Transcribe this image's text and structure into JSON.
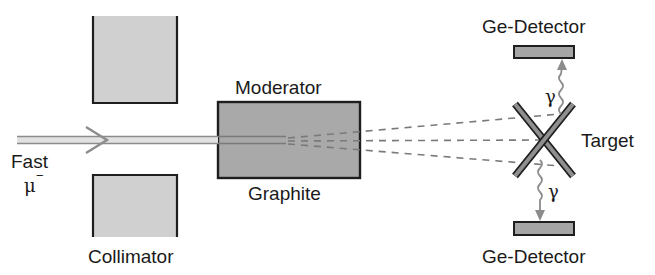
{
  "diagram": {
    "colors": {
      "block_fill": "#d0d0d0",
      "moderator_fill": "#a9a9a9",
      "detector_fill": "#a5a5a5",
      "outline": "#1e1e1e",
      "beam": "#8c8c8c",
      "dashes": "#7a7a7a"
    },
    "labels": {
      "beam_line1": "Fast",
      "beam_line2": "μ",
      "beam_charge": "−",
      "moderator_top": "Moderator",
      "moderator_bottom": "Graphite",
      "collimator": "Collimator",
      "target": "Target",
      "detector_top": "Ge-Detector",
      "detector_bottom": "Ge-Detector",
      "gamma_top": "γ",
      "gamma_bottom": "γ"
    },
    "components": [
      {
        "name": "collimator-top",
        "shape": "open-top block"
      },
      {
        "name": "collimator-bottom",
        "shape": "open-bottom block"
      },
      {
        "name": "moderator",
        "shape": "rectangle",
        "material": "Graphite"
      },
      {
        "name": "target",
        "shape": "X cross"
      },
      {
        "name": "ge-detector-top",
        "shape": "bar"
      },
      {
        "name": "ge-detector-bottom",
        "shape": "bar"
      }
    ]
  }
}
